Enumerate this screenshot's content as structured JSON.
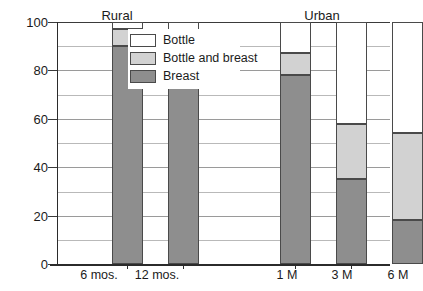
{
  "chart_data": {
    "type": "bar",
    "subtype": "stacked-bar",
    "title": "",
    "xlabel": "",
    "ylabel": "",
    "ylim": [
      0,
      100
    ],
    "yticks": [
      0,
      20,
      40,
      60,
      80,
      100
    ],
    "ytick_labels": [
      "0",
      "20",
      "40",
      "60",
      "80",
      "100"
    ],
    "minor_gridlines": [
      10,
      30,
      50,
      70,
      90
    ],
    "grid": true,
    "legend_position": "upper-center",
    "categories": [
      "6 mos.",
      "12 mos.",
      "1 M",
      "3 M",
      "6 M"
    ],
    "group_labels": [
      "Rural",
      "Urban"
    ],
    "groups": [
      {
        "name": "Rural",
        "categories": [
          "6 mos.",
          "12 mos."
        ]
      },
      {
        "name": "Urban",
        "categories": [
          "1 M",
          "3 M",
          "6 M"
        ]
      }
    ],
    "series": [
      {
        "name": "Breast",
        "color": "#8e8e8e",
        "values": [
          90,
          85,
          78,
          35,
          18
        ]
      },
      {
        "name": "Bottle and breast",
        "color": "#d2d2d2",
        "values": [
          7,
          8,
          9,
          23,
          36
        ]
      },
      {
        "name": "Bottle",
        "color": "#ffffff",
        "values": [
          3,
          7,
          13,
          42,
          46
        ]
      }
    ],
    "cumulative_tops": {
      "breast": [
        90,
        85,
        78,
        35,
        18
      ],
      "bottle_and_breast": [
        97,
        93,
        87,
        58,
        54
      ],
      "bottle": [
        100,
        100,
        100,
        100,
        100
      ]
    }
  },
  "legend": {
    "items": [
      {
        "label": "Bottle",
        "swatch": "bottle"
      },
      {
        "label": "Bottle and breast",
        "swatch": "both"
      },
      {
        "label": "Breast",
        "swatch": "breast"
      }
    ]
  },
  "axis": {
    "y_labels": [
      "100",
      "80",
      "60",
      "40",
      "20",
      "0"
    ]
  },
  "x_axis": {
    "labels": [
      "6 mos.",
      "12 mos.",
      "1 M",
      "3 M",
      "6 M"
    ]
  },
  "groups": {
    "rural": "Rural",
    "urban": "Urban"
  },
  "colors": {
    "breast": "#8e8e8e",
    "bottle_and_breast": "#d2d2d2",
    "bottle": "#ffffff",
    "axis": "#2b2b2b",
    "grid": "#9a9a9a",
    "grid_minor": "#b9b9b9",
    "text": "#1b1b1b"
  }
}
